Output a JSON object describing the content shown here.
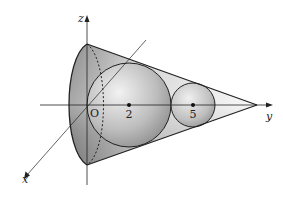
{
  "diagram": {
    "type": "3d-geometry",
    "axes": {
      "x_label": "x",
      "y_label": "y",
      "z_label": "z",
      "origin_label": "O"
    },
    "points": {
      "large_sphere_center_label": "2",
      "small_sphere_center_label": "5"
    },
    "colors": {
      "stroke": "#222222",
      "cone_fill_light": "#f4f4f4",
      "cone_fill_dark": "#8c8c8c",
      "sphere_fill_light": "#f0f0f0",
      "sphere_fill_dark": "#8a8a8a"
    }
  }
}
